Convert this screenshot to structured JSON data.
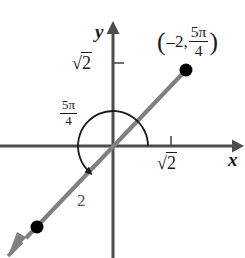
{
  "figure": {
    "type": "polar-coordinate-plot",
    "axes": {
      "x_label": "x",
      "y_label": "y",
      "x_tick_label_root": "2",
      "x_tick_label": "√2",
      "y_tick_label_root": "2",
      "y_tick_label": "√2"
    },
    "angle_label": {
      "numerator": "5π",
      "denominator": "4",
      "text": "5π/4"
    },
    "point_label": {
      "open_paren": "(",
      "radius": "–2,",
      "angle_numerator": "5π",
      "angle_denominator": "4",
      "close_paren": ")",
      "text": "(–2, 5π/4)"
    },
    "segment_length_label": "2",
    "colors": {
      "axis": "#4d4d4d",
      "ray": "#808080",
      "point": "#000000",
      "arc": "#1a1a1a",
      "text": "#1a1a1a",
      "background": "#ffffff"
    },
    "geometry": {
      "origin": [
        113,
        146
      ],
      "terminal_point": [
        186,
        70
      ],
      "opposite_point": [
        37,
        227
      ],
      "x_tick_x": 171,
      "y_tick_y": 63,
      "arc_radius": 35,
      "angle_degrees": 225
    }
  }
}
